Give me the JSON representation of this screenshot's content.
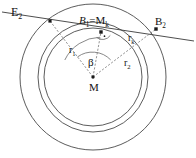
{
  "figure": {
    "type": "geometry-diagram",
    "background_color": "#ffffff",
    "stroke_color": "#4a4a4a",
    "label_color": "#121212",
    "width": 196,
    "height": 158
  },
  "labels": {
    "secant_line": {
      "base": "E",
      "sub": "2",
      "text": "E2"
    },
    "tangent_point": {
      "text": "B1 = Mk",
      "left": "B",
      "left_sub": "1",
      "eq": "=",
      "right": "M",
      "right_sub": "k"
    },
    "outer_point": {
      "base": "B",
      "sub": "2",
      "text": "B2"
    },
    "radius_inner": {
      "base": "r",
      "sub": "1",
      "text": "r1"
    },
    "radius_mid": {
      "base": "r",
      "sub": "k",
      "text": "rk"
    },
    "radius_outer": {
      "base": "r",
      "sub": "2",
      "text": "r2"
    },
    "angle": {
      "text": "β"
    },
    "center": {
      "text": "M"
    }
  },
  "geometry": {
    "center": {
      "x": 93,
      "y": 77,
      "name": "M"
    },
    "circles": [
      {
        "name": "inner-circle",
        "radius": 49,
        "label": "r1"
      },
      {
        "name": "middle-circle",
        "radius": 55,
        "label": "rk"
      },
      {
        "name": "outer-circle",
        "radius": 73,
        "label": "r2"
      }
    ],
    "points": [
      {
        "name": "B1",
        "x": 101,
        "y": 32
      },
      {
        "name": "B2",
        "x": 156,
        "y": 29
      },
      {
        "name": "left-intersection",
        "x": 50,
        "y": 21
      },
      {
        "name": "M",
        "x": 93,
        "y": 77
      }
    ],
    "secant": {
      "x1": 2,
      "y1": 12,
      "x2": 194,
      "y2": 41
    },
    "right_angle_at": "B1",
    "angle_beta_vertex": "M"
  }
}
